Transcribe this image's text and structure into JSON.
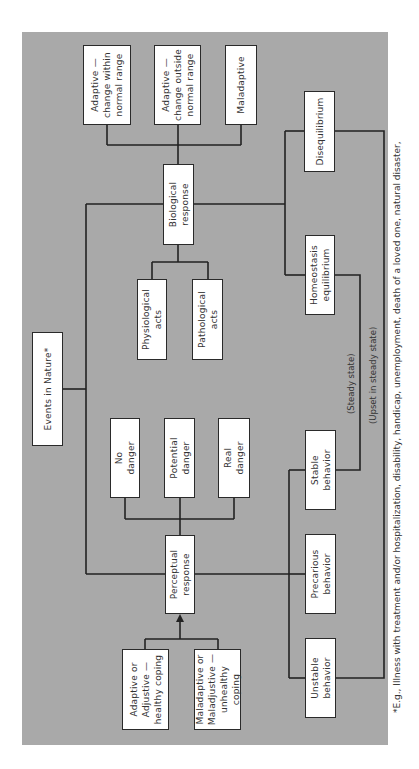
{
  "diagram": {
    "title_box": "Events in Nature*",
    "perceptual": {
      "label": "Perceptual\nresponse",
      "outcomes": [
        "No\ndanger",
        "Potential\ndanger",
        "Real\ndanger"
      ],
      "coping": [
        "Adaptive or\nAdjustive —\nhealthy coping",
        "Maladaptive or\nMaladjustive —\nunhealthy coping"
      ]
    },
    "biological": {
      "label": "Biological\nresponse",
      "acts": [
        "Physiological\nacts",
        "Pathological\nacts"
      ],
      "outcomes": [
        "Adaptive —\nchange within\nnormal range",
        "Adaptive —\nchange outside\nnormal range",
        "Maladaptive"
      ]
    },
    "states": {
      "disequilibrium": "Disequilibrium",
      "homeostasis": "Homeostasis\nequilibrium",
      "behaviors": [
        "Stable\nbehavior",
        "Precarious\nbehavior",
        "Unstable\nbehavior"
      ]
    },
    "connector_labels": {
      "steady": "(Steady state)",
      "upset": "(Upset in steady state)"
    },
    "footnote": "*E.g.,   Illness with treatment and/or hospitalization, disability, handicap, unemployment, death of a loved one, natural disaster,"
  }
}
